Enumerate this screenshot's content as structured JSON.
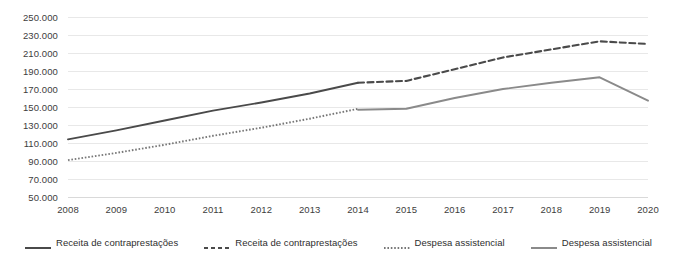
{
  "chart_data": {
    "type": "line",
    "title": "",
    "xlabel": "",
    "ylabel": "",
    "x": [
      2008,
      2009,
      2010,
      2011,
      2012,
      2013,
      2014,
      2015,
      2016,
      2017,
      2018,
      2019,
      2020
    ],
    "xtick_labels": [
      "2008",
      "2009",
      "2010",
      "2011",
      "2012",
      "2013",
      "2014",
      "2015",
      "2016",
      "2017",
      "2018",
      "2019",
      "2020"
    ],
    "ylim": [
      50000,
      250000
    ],
    "ytick_values": [
      50000,
      70000,
      90000,
      110000,
      130000,
      150000,
      170000,
      190000,
      210000,
      230000,
      250000
    ],
    "ytick_labels": [
      "50.000",
      "70.000",
      "90.000",
      "110.000",
      "130.000",
      "150.000",
      "170.000",
      "190.000",
      "210.000",
      "230.000",
      "250.000"
    ],
    "grid": true,
    "legend_position": "bottom",
    "series": [
      {
        "name": "Receita de contraprestações",
        "style": "solid",
        "color": "#4a4a4a",
        "x": [
          2008,
          2009,
          2010,
          2011,
          2012,
          2013,
          2014
        ],
        "values": [
          114000,
          124000,
          135000,
          146000,
          155000,
          165000,
          177000
        ]
      },
      {
        "name": "Receita de contraprestações",
        "style": "dashed",
        "color": "#4a4a4a",
        "x": [
          2014,
          2015,
          2016,
          2017,
          2018,
          2019,
          2020
        ],
        "values": [
          177000,
          179000,
          192000,
          205000,
          214000,
          223000,
          220000
        ]
      },
      {
        "name": "Despesa assistencial",
        "style": "dotted",
        "color": "#777777",
        "x": [
          2008,
          2009,
          2010,
          2011,
          2012,
          2013,
          2014
        ],
        "values": [
          91000,
          99000,
          108000,
          118000,
          127000,
          137000,
          148000
        ]
      },
      {
        "name": "Despesa assistencial",
        "style": "solid",
        "color": "#8a8a8a",
        "x": [
          2014,
          2015,
          2016,
          2017,
          2018,
          2019,
          2020
        ],
        "values": [
          147000,
          148000,
          160000,
          170000,
          177000,
          183000,
          157000
        ]
      }
    ]
  },
  "legend": {
    "items": [
      {
        "label": "Receita de contraprestações",
        "style": "solid",
        "color": "#4a4a4a"
      },
      {
        "label": "Receita de contraprestações",
        "style": "dashed",
        "color": "#4a4a4a"
      },
      {
        "label": "Despesa assistencial",
        "style": "dotted",
        "color": "#777777"
      },
      {
        "label": "Despesa assistencial",
        "style": "solid",
        "color": "#8a8a8a"
      }
    ]
  },
  "colors": {
    "grid": "#e8e8e8",
    "axis_text": "#3d3d3d",
    "background": "#ffffff"
  }
}
